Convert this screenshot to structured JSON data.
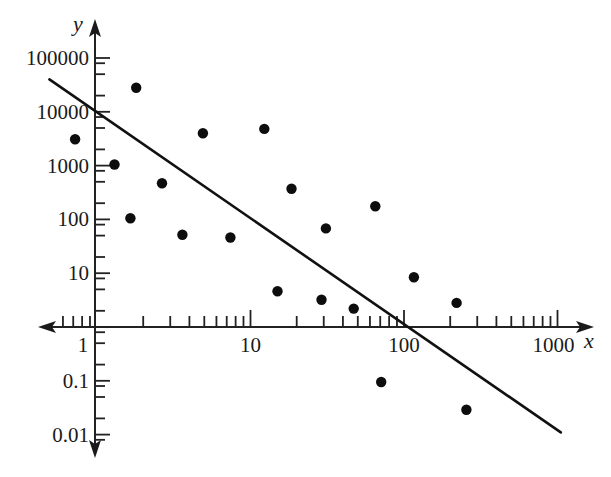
{
  "chart_data": {
    "type": "scatter",
    "title": "",
    "xlabel": "x",
    "ylabel": "y",
    "xscale": "log",
    "yscale": "log",
    "xlim": [
      0.45,
      1300
    ],
    "ylim": [
      0.006,
      300000
    ],
    "grid": false,
    "legend": null,
    "x_ticks": [
      1,
      10,
      100,
      1000
    ],
    "x_tick_labels": [
      "1",
      "10",
      "100",
      "1000"
    ],
    "x_minor_ticks": [
      0.6,
      0.7,
      0.8,
      0.9,
      2,
      3,
      4,
      5,
      6,
      7,
      8,
      9,
      20,
      30,
      40,
      50,
      60,
      70,
      80,
      90,
      200,
      300,
      400,
      500,
      600,
      700,
      800,
      900
    ],
    "y_ticks": [
      100000,
      10000,
      1000,
      100,
      10,
      1,
      0.1,
      0.01
    ],
    "y_tick_labels": [
      "100000",
      "10000",
      "1000",
      "100",
      "10",
      "1",
      "0.1",
      "0.01"
    ],
    "y_minor_factors": [
      0.8,
      0.5,
      0.2
    ],
    "shared_origin_label": "1",
    "series": [
      {
        "name": "data points",
        "type": "scatter",
        "points": [
          [
            0.72,
            3100
          ],
          [
            1.8,
            28000
          ],
          [
            1.3,
            1050
          ],
          [
            2.65,
            470
          ],
          [
            1.65,
            105
          ],
          [
            3.6,
            52
          ],
          [
            4.9,
            4000
          ],
          [
            7.4,
            46
          ],
          [
            12.3,
            4800
          ],
          [
            18.5,
            370
          ],
          [
            65,
            175
          ],
          [
            31,
            68
          ],
          [
            116,
            8.4
          ],
          [
            15,
            4.6
          ],
          [
            29,
            3.2
          ],
          [
            47,
            2.2
          ],
          [
            220,
            2.8
          ],
          [
            71,
            0.095
          ],
          [
            255,
            0.029
          ]
        ]
      },
      {
        "name": "fitted line",
        "type": "line",
        "points": [
          [
            0.49,
            40000
          ],
          [
            1050,
            0.011
          ]
        ]
      }
    ]
  }
}
